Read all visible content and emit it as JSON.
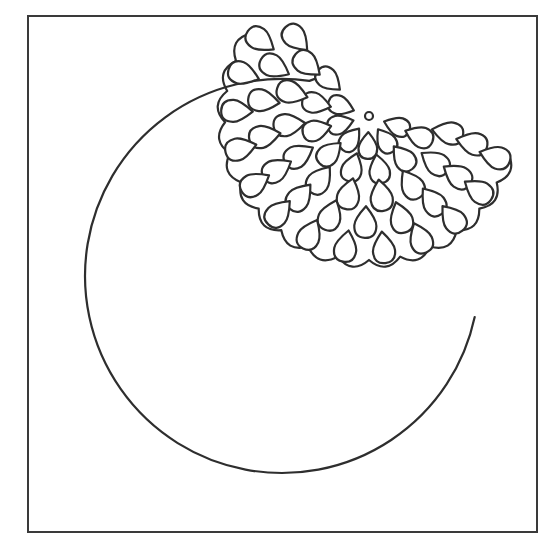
{
  "artwork": {
    "title": "Circle with scalloped dahlia flower cut template",
    "colors": {
      "line": "#2e2e2e",
      "frame": "#3a3a3a",
      "background": "#ffffff"
    },
    "frame": {
      "x": 28,
      "y": 16,
      "width": 509,
      "height": 516
    },
    "circle": {
      "cx": 282,
      "cy": 276,
      "r": 197,
      "gap_start_deg": -82,
      "gap_end_deg": 12
    },
    "flower": {
      "center": {
        "cx": 369,
        "cy": 116,
        "r": 4
      },
      "rings": [
        {
          "radius": 26,
          "count": 6,
          "start_deg": 20,
          "end_deg": 200,
          "size": 11
        },
        {
          "radius": 50,
          "count": 8,
          "start_deg": 15,
          "end_deg": 215,
          "size": 12
        },
        {
          "radius": 76,
          "count": 10,
          "start_deg": 12,
          "end_deg": 220,
          "size": 13
        },
        {
          "radius": 102,
          "count": 12,
          "start_deg": 10,
          "end_deg": 222,
          "size": 13
        },
        {
          "radius": 128,
          "count": 13,
          "start_deg": 18,
          "end_deg": 215,
          "size": 13
        }
      ],
      "scallop_radius": 144,
      "scallop_start_deg": 15,
      "scallop_end_deg": 215,
      "scallop_count": 16
    }
  }
}
